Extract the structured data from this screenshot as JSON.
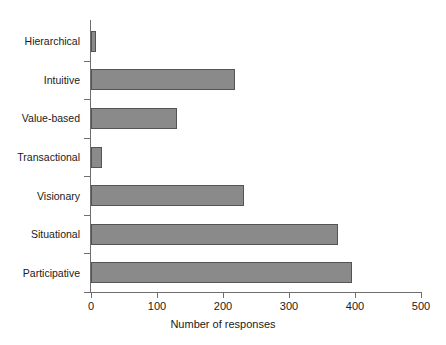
{
  "chart_data": {
    "type": "bar",
    "orientation": "horizontal",
    "title": "",
    "xlabel": "Number of responses",
    "ylabel": "",
    "categories": [
      "Hierarchical",
      "Intuitive",
      "Value-based",
      "Transactional",
      "Visionary",
      "Situational",
      "Participative"
    ],
    "values": [
      8,
      218,
      130,
      17,
      232,
      374,
      395
    ],
    "xlim": [
      0,
      500
    ],
    "xticks": [
      0,
      100,
      200,
      300,
      400,
      500
    ],
    "xtick_labels": [
      "0",
      "100",
      "200",
      "300",
      "400",
      "500"
    ],
    "grid": false,
    "legend": false,
    "series": [
      {
        "name": "Number of responses",
        "values": [
          8,
          218,
          130,
          17,
          232,
          374,
          395
        ]
      }
    ],
    "colors": {
      "bar_fill": "#8a8a8a",
      "bar_border": "#545454",
      "axis": "#6e6e6e",
      "text": "#1a1a1a",
      "background": "#ffffff"
    }
  }
}
